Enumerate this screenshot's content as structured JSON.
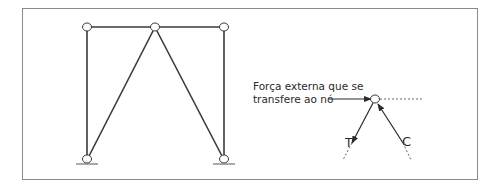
{
  "diagram": {
    "caption_line1": "Força externa que se",
    "caption_line2": "transfere ao nó",
    "label_tension": "T",
    "label_compression": "C",
    "colors": {
      "stroke": "#3a3a3a",
      "frame": "#8a8a8a",
      "dashed": "#666666"
    },
    "truss": {
      "nodes": [
        {
          "id": "top-left",
          "x": 87,
          "y": 27
        },
        {
          "id": "top-middle",
          "x": 155,
          "y": 27
        },
        {
          "id": "top-right",
          "x": 224,
          "y": 27
        },
        {
          "id": "support-left",
          "x": 87,
          "y": 159
        },
        {
          "id": "support-right",
          "x": 224,
          "y": 159
        }
      ],
      "members": [
        [
          "top-left",
          "top-middle"
        ],
        [
          "top-middle",
          "top-right"
        ],
        [
          "top-left",
          "support-left"
        ],
        [
          "top-right",
          "support-right"
        ],
        [
          "top-middle",
          "support-left"
        ],
        [
          "top-middle",
          "support-right"
        ]
      ]
    }
  }
}
